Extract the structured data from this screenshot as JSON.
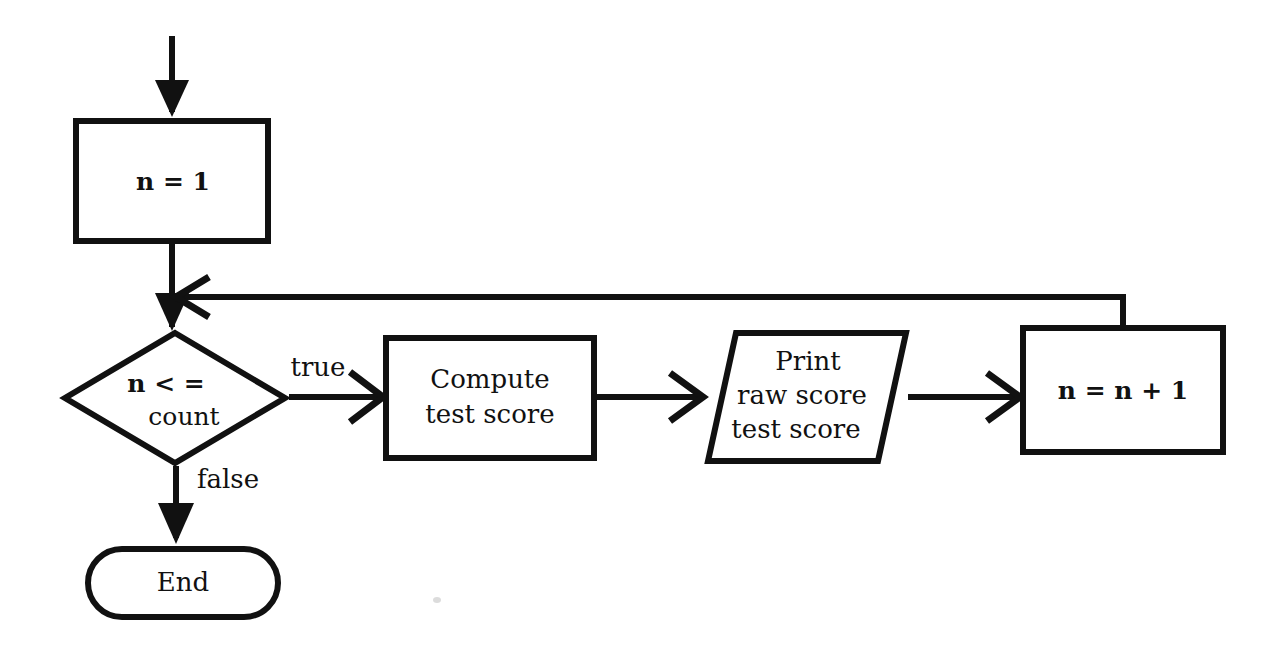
{
  "diagram": {
    "background_color": "#ffffff",
    "stroke_color": "#111111",
    "nodes": {
      "init": {
        "shape": "rectangle",
        "label": "n = 1"
      },
      "decision": {
        "shape": "diamond",
        "label_line1": "n < =",
        "label_line2": "count"
      },
      "compute": {
        "shape": "rectangle",
        "label_line1": "Compute",
        "label_line2": "test score"
      },
      "print": {
        "shape": "parallelogram",
        "label_line1": "Print",
        "label_line2": "raw score",
        "label_line3": "test score"
      },
      "increment": {
        "shape": "rectangle",
        "label": "n = n + 1"
      },
      "end": {
        "shape": "stadium",
        "label": "End"
      }
    },
    "edge_labels": {
      "true_branch": "true",
      "false_branch": "false"
    }
  }
}
